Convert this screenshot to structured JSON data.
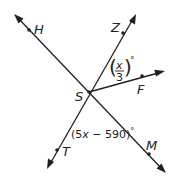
{
  "diagram": {
    "vertex": {
      "label": "S",
      "x": 89,
      "y": 92
    },
    "lines": [
      {
        "name": "line-HM",
        "from": [
          14,
          14
        ],
        "to": [
          166,
          173
        ],
        "points": [
          "H",
          "M"
        ]
      },
      {
        "name": "line-ZT",
        "from": [
          136,
          14
        ],
        "to": [
          47,
          169
        ],
        "points": [
          "Z",
          "T"
        ]
      }
    ],
    "rays": [
      {
        "name": "ray-SF",
        "from": [
          89,
          92
        ],
        "to": [
          165,
          71
        ],
        "points": [
          "F"
        ]
      }
    ],
    "points": {
      "H": {
        "label": "H",
        "x": 29,
        "y": 30,
        "lx": 34,
        "ly": 33
      },
      "Z": {
        "label": "Z",
        "x": 123,
        "y": 33,
        "lx": 110,
        "ly": 30
      },
      "F": {
        "label": "F",
        "x": 142,
        "y": 76,
        "lx": 136,
        "ly": 93
      },
      "S": {
        "label": "S",
        "x": 89,
        "y": 92,
        "lx": 76,
        "ly": 100
      },
      "T": {
        "label": "T",
        "x": 57,
        "y": 150,
        "lx": 62,
        "ly": 155
      },
      "M": {
        "label": "M",
        "x": 149,
        "y": 154,
        "lx": 144,
        "ly": 149
      }
    },
    "angles": {
      "ZSF": {
        "numerator": "x",
        "denominator": "3",
        "degree": "°"
      },
      "TSM": {
        "prefix": "(5",
        "variable": "x",
        "suffix": " − 590)",
        "degree": "°"
      }
    }
  }
}
